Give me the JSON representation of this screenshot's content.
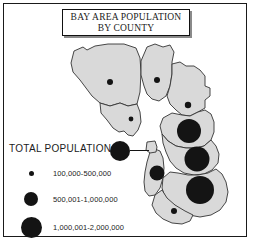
{
  "title": {
    "line1": "BAY AREA POPULATION",
    "line2": "BY COUNTY"
  },
  "legend": {
    "heading": "TOTAL POPULATION",
    "classes": [
      {
        "label": "100,000-500,000",
        "size": 5
      },
      {
        "label": "500,001-1,000,000",
        "size": 14
      },
      {
        "label": "1,000,001-2,000,000",
        "size": 21
      }
    ]
  },
  "colors": {
    "county_fill": "#d9d9d9",
    "county_stroke": "#333333",
    "symbol": "#141414",
    "water": "#ffffff",
    "frame": "#1a1a1a",
    "title_shadow": "#8a8a8a"
  },
  "map": {
    "water_label": "bay",
    "counties": [
      {
        "name": "sonoma",
        "cx": 110,
        "cy": 82,
        "r": 3.0
      },
      {
        "name": "napa",
        "cx": 157,
        "cy": 80,
        "r": 3.0
      },
      {
        "name": "solano",
        "cx": 188,
        "cy": 105,
        "r": 3.2
      },
      {
        "name": "marin",
        "cx": 131,
        "cy": 119,
        "r": 2.4
      },
      {
        "name": "contra-costa",
        "cx": 189,
        "cy": 131,
        "r": 12.0
      },
      {
        "name": "alameda",
        "cx": 197,
        "cy": 159,
        "r": 12.5
      },
      {
        "name": "san-mateo",
        "cx": 157,
        "cy": 173,
        "r": 7.5
      },
      {
        "name": "santa-clara",
        "cx": 200,
        "cy": 190,
        "r": 14.0
      },
      {
        "name": "santa-cruz",
        "cx": 174,
        "cy": 211,
        "r": 3.0
      }
    ],
    "callout": {
      "name": "san-francisco",
      "circle_cx": 120,
      "circle_cy": 151,
      "circle_r": 10,
      "leader_from_x": 130,
      "leader_to_x": 149,
      "leader_y": 151
    }
  }
}
